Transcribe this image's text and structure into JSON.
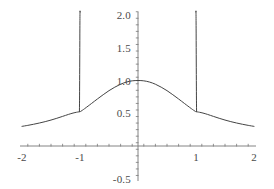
{
  "chart_data": {
    "type": "line",
    "title": "",
    "subtitle": "",
    "xlabel": "",
    "ylabel": "",
    "xlim": [
      -2.1,
      2.1
    ],
    "ylim": [
      -0.55,
      2.05
    ],
    "grid": false,
    "legend": null,
    "background_color": "#ffffff",
    "axis_color": "#777777",
    "curve_color": "#444444",
    "label_color": "#4a4a4a",
    "xticks": [
      -2,
      -1,
      0,
      1,
      2
    ],
    "xtick_labels": [
      "-2",
      "-1",
      "",
      "1",
      "2"
    ],
    "yticks": [
      -0.5,
      0,
      0.5,
      1.0,
      1.5,
      2.0
    ],
    "ytick_labels": [
      "-0.5",
      "",
      "0.5",
      "1.0",
      "1.5",
      "2.0"
    ],
    "x_minor_tick_step": 0.2,
    "y_minor_tick_step": 0.1,
    "asymptotes": [
      -1,
      1
    ],
    "peak": {
      "x": 0,
      "y": 1.0
    },
    "annotations": [],
    "series": [
      {
        "name": "f(x)",
        "comment": "smooth bell body with vertical asymptotic spikes at x = -1 and x = 1",
        "segments": [
          {
            "name": "left-tail",
            "x": [
              -2.0,
              -1.9,
              -1.8,
              -1.7,
              -1.6,
              -1.5,
              -1.4,
              -1.3,
              -1.2,
              -1.12,
              -1.06,
              -1.03,
              -1.01
            ],
            "y": [
              0.3,
              0.315,
              0.332,
              0.351,
              0.372,
              0.396,
              0.423,
              0.452,
              0.482,
              0.503,
              0.515,
              0.52,
              0.523
            ]
          },
          {
            "name": "left-spike",
            "x": [
              -1.01,
              -1.008,
              -1.006,
              -1.004,
              -1.002,
              -1.0,
              -0.999,
              -0.998
            ],
            "y": [
              0.523,
              0.7,
              1.0,
              1.4,
              1.8,
              2.05,
              2.05,
              2.05
            ]
          },
          {
            "name": "center-body",
            "x": [
              -0.99,
              -0.96,
              -0.92,
              -0.86,
              -0.8,
              -0.7,
              -0.6,
              -0.5,
              -0.4,
              -0.3,
              -0.2,
              -0.1,
              0.0,
              0.1,
              0.2,
              0.3,
              0.4,
              0.5,
              0.6,
              0.7,
              0.8,
              0.86,
              0.92,
              0.96,
              0.99
            ],
            "y": [
              0.527,
              0.545,
              0.57,
              0.61,
              0.65,
              0.718,
              0.783,
              0.845,
              0.898,
              0.943,
              0.976,
              0.995,
              1.0,
              0.995,
              0.976,
              0.943,
              0.898,
              0.845,
              0.783,
              0.718,
              0.65,
              0.61,
              0.57,
              0.545,
              0.527
            ]
          },
          {
            "name": "right-spike",
            "x": [
              0.998,
              0.999,
              1.0,
              1.002,
              1.004,
              1.006,
              1.008,
              1.01
            ],
            "y": [
              2.05,
              2.05,
              2.05,
              1.8,
              1.4,
              1.0,
              0.7,
              0.523
            ]
          },
          {
            "name": "right-tail",
            "x": [
              1.01,
              1.03,
              1.06,
              1.12,
              1.2,
              1.3,
              1.4,
              1.5,
              1.6,
              1.7,
              1.8,
              1.9,
              2.0
            ],
            "y": [
              0.523,
              0.52,
              0.515,
              0.503,
              0.482,
              0.452,
              0.423,
              0.396,
              0.372,
              0.351,
              0.332,
              0.315,
              0.3
            ]
          }
        ]
      }
    ]
  }
}
